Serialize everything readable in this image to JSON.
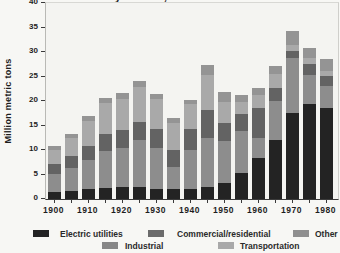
{
  "title_fragment": "by sector, 1900-1980",
  "ylabel": "Million metric tons",
  "legend": {
    "items": [
      {
        "label": "Electric utilities",
        "color": "#232323",
        "row": 1,
        "chip_x": 33,
        "label_x": 60
      },
      {
        "label": "Commercial/residential",
        "color": "#6b6b6b",
        "row": 1,
        "chip_x": 148,
        "label_x": 177
      },
      {
        "label": "Other",
        "color": "#8f8f8f",
        "row": 1,
        "chip_x": 293,
        "label_x": 315
      },
      {
        "label": "Industrial",
        "color": "#878787",
        "row": 2,
        "chip_x": 102,
        "label_x": 125
      },
      {
        "label": "Transportation",
        "color": "#a9a9a9",
        "row": 2,
        "chip_x": 218,
        "label_x": 240
      }
    ]
  },
  "chart_data": {
    "type": "bar",
    "subtype": "stacked-vertical",
    "xlabel": "",
    "ylabel": "Million metric tons",
    "ylim": [
      0,
      40
    ],
    "yticks": [
      0,
      5,
      10,
      15,
      20,
      25,
      30,
      35,
      40
    ],
    "grid": false,
    "legend_position": "bottom",
    "categories": [
      1900,
      1905,
      1910,
      1915,
      1920,
      1925,
      1930,
      1935,
      1940,
      1945,
      1950,
      1955,
      1960,
      1965,
      1970,
      1975,
      1980
    ],
    "xtick_labels": [
      "1900",
      "1910",
      "1920",
      "1930",
      "1940",
      "1950",
      "1960",
      "1970",
      "1980"
    ],
    "stack_order_bottom_to_top": [
      "Electric utilities",
      "Industrial",
      "Commercial/residential",
      "Transportation",
      "Other"
    ],
    "series": [
      {
        "name": "Electric utilities",
        "color": "#232323",
        "values": [
          1.4,
          1.7,
          2.0,
          2.3,
          2.5,
          2.5,
          2.0,
          2.0,
          2.0,
          2.4,
          3.3,
          5.4,
          8.4,
          12.0,
          17.6,
          19.3,
          18.6
        ]
      },
      {
        "name": "Industrial",
        "color": "#8d8d8d",
        "values": [
          3.7,
          4.6,
          6.0,
          7.6,
          8.0,
          9.5,
          8.5,
          4.5,
          8.1,
          10.0,
          8.5,
          8.5,
          4.1,
          8.0,
          11.2,
          6.1,
          4.5
        ]
      },
      {
        "name": "Commercial/residential",
        "color": "#636363",
        "values": [
          2.0,
          2.4,
          2.9,
          3.4,
          3.5,
          3.8,
          3.7,
          3.5,
          4.1,
          5.8,
          3.8,
          3.4,
          6.1,
          2.6,
          1.4,
          2.1,
          2.0
        ]
      },
      {
        "name": "Transportation",
        "color": "#a9a9a9",
        "values": [
          3.0,
          3.8,
          5.0,
          6.2,
          6.5,
          7.0,
          6.2,
          5.6,
          5.1,
          7.1,
          4.2,
          2.4,
          2.6,
          3.0,
          1.3,
          1.2,
          1.0
        ]
      },
      {
        "name": "Other",
        "color": "#949494",
        "values": [
          0.7,
          0.8,
          1.0,
          1.1,
          1.2,
          1.2,
          1.1,
          1.0,
          1.0,
          2.0,
          2.0,
          1.5,
          1.5,
          1.5,
          2.8,
          2.2,
          2.4
        ]
      }
    ],
    "totals": [
      10.8,
      13.3,
      16.9,
      20.6,
      21.7,
      24.0,
      21.5,
      16.6,
      20.3,
      27.3,
      21.8,
      21.2,
      22.7,
      27.1,
      34.3,
      30.9,
      28.5
    ]
  }
}
